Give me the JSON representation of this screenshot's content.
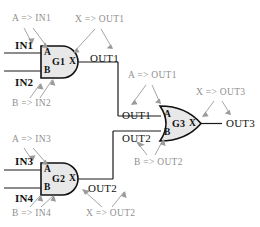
{
  "diagram": {
    "colors": {
      "wire": "#1a1a1a",
      "gate_fill": "#e8e8e8",
      "gate_stroke": "#111111",
      "annotation": "#9a9a9a",
      "background": "#ffffff"
    },
    "gates": [
      {
        "id": "G1",
        "type": "AND",
        "name_label": "G1",
        "input_a_label": "A",
        "input_b_label": "B",
        "output_label": "X"
      },
      {
        "id": "G2",
        "type": "AND",
        "name_label": "G2",
        "input_a_label": "A",
        "input_b_label": "B",
        "output_label": "X"
      },
      {
        "id": "G3",
        "type": "OR",
        "name_label": "G3",
        "input_a_label": "A",
        "input_b_label": "B",
        "output_label": "X"
      }
    ],
    "signals": {
      "in1": "IN1",
      "in2": "IN2",
      "in3": "IN3",
      "in4": "IN4",
      "out1_top": "OUT1",
      "out1_mid": "OUT1",
      "out2_bottom": "OUT2",
      "out2_mid": "OUT2",
      "out3": "OUT3"
    },
    "annotations": [
      {
        "id": "a-in1",
        "text": "A => IN1"
      },
      {
        "id": "x-out1",
        "text": "X => OUT1"
      },
      {
        "id": "b-in2",
        "text": "B => IN2"
      },
      {
        "id": "a-out1",
        "text": "A => OUT1"
      },
      {
        "id": "x-out3",
        "text": "X => OUT3"
      },
      {
        "id": "a-in3",
        "text": "A => IN3"
      },
      {
        "id": "b-out2",
        "text": "B => OUT2"
      },
      {
        "id": "b-in4",
        "text": "B => IN4"
      },
      {
        "id": "x-out2",
        "text": "X => OUT2"
      }
    ]
  }
}
